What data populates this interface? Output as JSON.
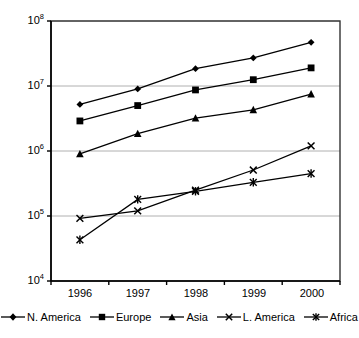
{
  "chart_data": {
    "type": "line",
    "title": "",
    "subtitle": "",
    "xlabel": "",
    "ylabel": "",
    "categories": [
      "1996",
      "1997",
      "1998",
      "1999",
      "2000"
    ],
    "yscale": "log",
    "ylim": [
      10000,
      100000000
    ],
    "ytick_labels": [
      "10⁴",
      "10⁵",
      "10⁶",
      "10⁷",
      "10⁸"
    ],
    "ytick_values": [
      10000,
      100000,
      1000000,
      10000000,
      100000000
    ],
    "grid": "horizontal",
    "legend_position": "bottom",
    "series": [
      {
        "name": "N. America",
        "marker": "diamond",
        "color": "#000000",
        "values": [
          5200000,
          9000000,
          18500000,
          27000000,
          47000000
        ]
      },
      {
        "name": "Europe",
        "marker": "square",
        "color": "#000000",
        "values": [
          2900000,
          5000000,
          8700000,
          12500000,
          19000000
        ]
      },
      {
        "name": "Asia",
        "marker": "triangle",
        "color": "#000000",
        "values": [
          900000,
          1850000,
          3200000,
          4300000,
          7500000
        ]
      },
      {
        "name": "L. America",
        "marker": "cross-x",
        "color": "#000000",
        "values": [
          92000,
          120000,
          250000,
          510000,
          1200000
        ]
      },
      {
        "name": "Africa",
        "marker": "star",
        "color": "#000000",
        "values": [
          43000,
          180000,
          240000,
          330000,
          450000
        ]
      }
    ]
  },
  "axes": {
    "y_labels": [
      {
        "base": "10",
        "exp": "8"
      },
      {
        "base": "10",
        "exp": "7"
      },
      {
        "base": "10",
        "exp": "6"
      },
      {
        "base": "10",
        "exp": "5"
      },
      {
        "base": "10",
        "exp": "4"
      }
    ],
    "x_labels": [
      "1996",
      "1997",
      "1998",
      "1999",
      "2000"
    ]
  },
  "legend": {
    "items": [
      {
        "label": "N. America",
        "marker": "diamond"
      },
      {
        "label": "Europe",
        "marker": "square"
      },
      {
        "label": "Asia",
        "marker": "triangle"
      },
      {
        "label": "L. America",
        "marker": "cross-x"
      },
      {
        "label": "Africa",
        "marker": "star"
      }
    ]
  },
  "colors": {
    "series": "#000000",
    "gridline": "#b0b0b0",
    "axis": "#333333",
    "background": "#ffffff"
  }
}
